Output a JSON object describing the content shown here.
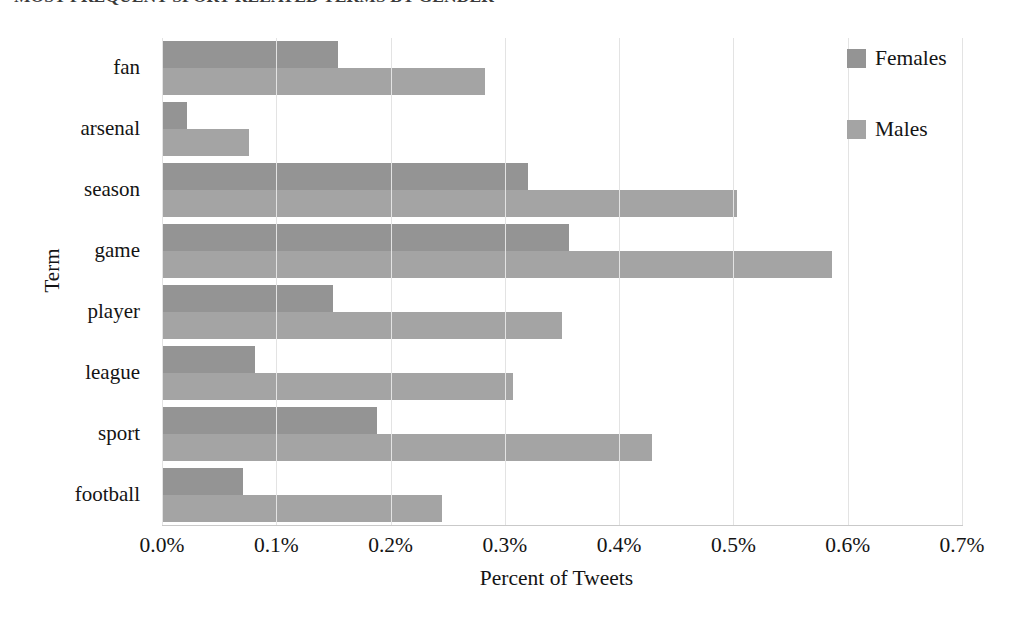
{
  "chart_data": {
    "type": "bar",
    "orientation": "horizontal",
    "title": "MOST FREQUENT SPORT-RELATED TERMS BY GENDER",
    "categories": [
      "fan",
      "arsenal",
      "season",
      "game",
      "player",
      "league",
      "sport",
      "football"
    ],
    "series": [
      {
        "name": "Females",
        "color": "#949494",
        "values": [
          0.154,
          0.022,
          0.32,
          0.356,
          0.15,
          0.081,
          0.188,
          0.071
        ]
      },
      {
        "name": "Males",
        "color": "#a4a4a4",
        "values": [
          0.283,
          0.076,
          0.503,
          0.586,
          0.35,
          0.307,
          0.429,
          0.245
        ]
      }
    ],
    "xlabel": "Percent of Tweets",
    "ylabel": "Term",
    "xlim": [
      0,
      0.7
    ],
    "xticks": [
      0,
      0.1,
      0.2,
      0.3,
      0.4,
      0.5,
      0.6,
      0.7
    ],
    "xticklabels": [
      "0.0%",
      "0.1%",
      "0.2%",
      "0.3%",
      "0.4%",
      "0.5%",
      "0.6%",
      "0.7%"
    ],
    "grid": "vertical",
    "legend_position": "top-right",
    "legend": [
      "Females",
      "Males"
    ],
    "units": "percent"
  },
  "axes": {
    "y_title": "Term",
    "x_title": "Percent of Tweets"
  },
  "legend": {
    "items": [
      {
        "label": "Females",
        "color": "#949494"
      },
      {
        "label": "Males",
        "color": "#a4a4a4"
      }
    ]
  },
  "colors": {
    "females": "#949494",
    "males": "#a4a4a4",
    "gridline": "#e3e3e3",
    "axis": "#c9c9c9",
    "text": "#141414",
    "background": "#ffffff"
  }
}
